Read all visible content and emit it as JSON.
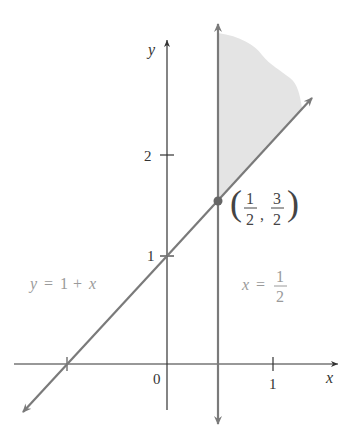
{
  "diagram": {
    "type": "coordinate-plane-region",
    "axes": {
      "x_label": "x",
      "y_label": "y",
      "origin_label": "0",
      "x_ticks": [
        {
          "value": -1,
          "label": ""
        },
        {
          "value": 1,
          "label": "1"
        }
      ],
      "y_ticks": [
        {
          "value": 1,
          "label": "1"
        },
        {
          "value": 2,
          "label": "2"
        }
      ]
    },
    "lines": [
      {
        "id": "diagonal",
        "equation_label": "y = 1 + x",
        "label_lhs": "y",
        "label_rhs_num": "1",
        "label_rhs_var": "x"
      },
      {
        "id": "vertical",
        "equation_label": "x = 1/2",
        "label_var": "x",
        "frac_num": "1",
        "frac_den": "2"
      }
    ],
    "intersection": {
      "label": "(1/2, 3/2)",
      "x_num": "1",
      "x_den": "2",
      "y_num": "3",
      "y_den": "2"
    },
    "shaded_region": "x ≥ 1/2, y ≥ 1 + x",
    "colors": {
      "axis": "#333333",
      "line": "#7a7a7a",
      "shade": "#e4e4e4",
      "label_gray": "#9a9a9a",
      "text": "#333333"
    }
  }
}
